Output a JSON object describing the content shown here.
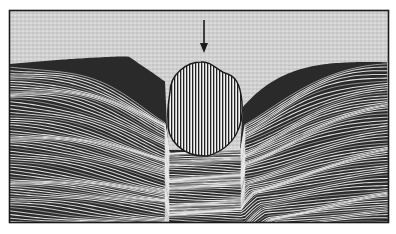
{
  "figure": {
    "description": "Line illustration: a rounded object (vertical hatching) pressed into layered fibrous material beneath a stippled upper region, with a downward arrow above it",
    "colors": {
      "background": "#ffffff",
      "frame": "#1a1a1a",
      "stipple_region": "#cfcfcf",
      "fiber_dark": "#1e1e1e",
      "fiber_light": "#f4f4f4",
      "object_fill": "#f0f0f0",
      "object_hatch": "#1e1e1e"
    },
    "frame": {
      "x": 9,
      "y": 10,
      "width": 380,
      "height": 213
    },
    "arrow": {
      "x": 204,
      "y1": 20,
      "y2": 53,
      "label": "pressure-direction-arrow"
    },
    "object": {
      "label": "embedded-object",
      "cx": 205,
      "top": 62,
      "bottom": 156,
      "left": 168,
      "right": 242
    },
    "layers": {
      "label": "fibrous-layers",
      "surface_left_y": 62,
      "surface_right_y": 68,
      "line_count": 70,
      "trough_x": 210
    }
  }
}
